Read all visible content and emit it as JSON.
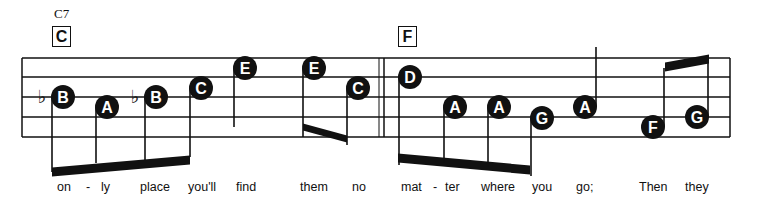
{
  "chord_symbols": [
    {
      "name": "C7",
      "x": 54,
      "y": 6
    }
  ],
  "measure_labels": [
    {
      "label": "C",
      "x": 52,
      "y": 26
    },
    {
      "label": "F",
      "x": 398,
      "y": 26
    }
  ],
  "staff": {
    "x_start": 22,
    "x_end": 730,
    "lines_y": [
      58,
      77,
      97,
      117,
      137
    ],
    "barline_x": [
      22,
      384,
      730
    ],
    "color": "#111111"
  },
  "notes": [
    {
      "letter": "B",
      "x": 63,
      "y": 97,
      "accidental": "flat",
      "stem": "down",
      "stem_end": 172
    },
    {
      "letter": "A",
      "x": 107,
      "y": 107,
      "stem": "down",
      "stem_end": 163
    },
    {
      "letter": "B",
      "x": 156,
      "y": 97,
      "accidental": "flat",
      "stem": "down",
      "stem_end": 160
    },
    {
      "letter": "C",
      "x": 201,
      "y": 88,
      "stem": "down",
      "stem_end": 157
    },
    {
      "letter": "E",
      "x": 245,
      "y": 68,
      "stem": "down",
      "stem_end": 127
    },
    {
      "letter": "E",
      "x": 314,
      "y": 68,
      "stem": "down",
      "stem_end": 137
    },
    {
      "letter": "C",
      "x": 358,
      "y": 88,
      "stem": "down",
      "stem_end": 145
    },
    {
      "letter": "D",
      "x": 410,
      "y": 77,
      "stem": "down",
      "stem_end": 165
    },
    {
      "letter": "A",
      "x": 455,
      "y": 107,
      "stem": "down",
      "stem_end": 163
    },
    {
      "letter": "A",
      "x": 499,
      "y": 107,
      "stem": "down",
      "stem_end": 167
    },
    {
      "letter": "G",
      "x": 542,
      "y": 118,
      "stem": "down",
      "stem_end": 176
    },
    {
      "letter": "A",
      "x": 585,
      "y": 107,
      "stem": "up",
      "stem_end": 47
    },
    {
      "letter": "F",
      "x": 653,
      "y": 127,
      "stem": "up",
      "stem_end": 68
    },
    {
      "letter": "G",
      "x": 697,
      "y": 117,
      "stem": "up",
      "stem_end": 62
    }
  ],
  "beams": [
    {
      "x1": 52,
      "y1": 172,
      "x2": 190,
      "y2": 160,
      "thickness": 9
    },
    {
      "x1": 303,
      "y1": 127,
      "x2": 347,
      "y2": 139,
      "thickness": 7
    },
    {
      "x1": 398,
      "y1": 158,
      "x2": 530,
      "y2": 170,
      "thickness": 9
    },
    {
      "x1": 665,
      "y1": 67,
      "x2": 709,
      "y2": 59,
      "thickness": 9
    }
  ],
  "lyrics": [
    {
      "text": "on",
      "x": 57
    },
    {
      "text": "-",
      "x": 86
    },
    {
      "text": "ly",
      "x": 101
    },
    {
      "text": "place",
      "x": 140
    },
    {
      "text": "you'll",
      "x": 188
    },
    {
      "text": "find",
      "x": 236
    },
    {
      "text": "them",
      "x": 300
    },
    {
      "text": "no",
      "x": 352
    },
    {
      "text": "mat",
      "x": 401
    },
    {
      "text": "-",
      "x": 433
    },
    {
      "text": "ter",
      "x": 445
    },
    {
      "text": "where",
      "x": 481
    },
    {
      "text": "you",
      "x": 532
    },
    {
      "text": "go;",
      "x": 576
    },
    {
      "text": "Then",
      "x": 639
    },
    {
      "text": "they",
      "x": 685
    }
  ]
}
